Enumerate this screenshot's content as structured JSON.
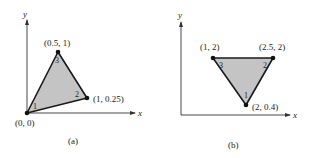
{
  "diagrams": [
    {
      "id": "a",
      "caption": "(a)",
      "axes": {
        "x_label": "x",
        "y_label": "y"
      },
      "vertices": [
        {
          "node": "1",
          "coord_label": "(0, 0)",
          "x": 0,
          "y": 0
        },
        {
          "node": "2",
          "coord_label": "(1, 0.25)",
          "x": 1,
          "y": 0.25
        },
        {
          "node": "3",
          "coord_label": "(0.5, 1)",
          "x": 0.5,
          "y": 1
        }
      ]
    },
    {
      "id": "b",
      "caption": "(b)",
      "axes": {
        "x_label": "x",
        "y_label": "y"
      },
      "vertices": [
        {
          "node": "1",
          "coord_label": "(2, 0.4)",
          "x": 2,
          "y": 0.4
        },
        {
          "node": "2",
          "coord_label": "(2.5, 2)",
          "x": 2.5,
          "y": 2
        },
        {
          "node": "3",
          "coord_label": "(1, 2)",
          "x": 1,
          "y": 2
        }
      ]
    }
  ],
  "colors": {
    "fill": "#c4c4c4",
    "edge": "#1a1a1a",
    "axis": "#333333"
  }
}
